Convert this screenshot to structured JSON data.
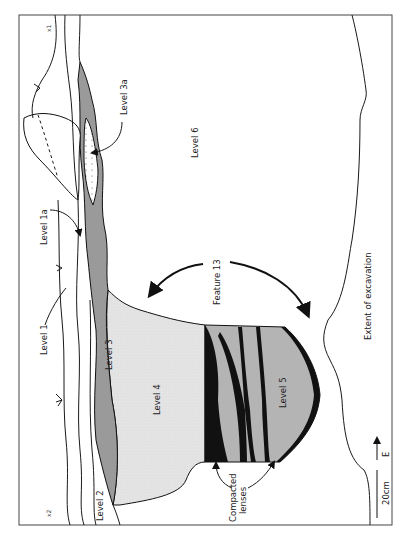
{
  "figure": {
    "labels": {
      "level1": "Level 1",
      "level1a": "Level 1a",
      "level2": "Level 2",
      "level3": "Level 3",
      "level3a": "Level 3a",
      "level4": "Level 4",
      "level5": "Level 5",
      "level6": "Level 6",
      "feature": "Feature 13",
      "compacted_line1": "Compacted",
      "compacted_line2": "lenses",
      "extent": "Extent of excavation",
      "scale": "20cm",
      "north": "E",
      "corner_top": "x1",
      "corner_bottom": "x2"
    },
    "colors": {
      "level3_fill": "#9a9a9a",
      "level4_fill": "#e2e2e2",
      "level5_fill": "#b4b4b4",
      "lens_fill": "#111111",
      "line": "#1a1a1a"
    }
  }
}
